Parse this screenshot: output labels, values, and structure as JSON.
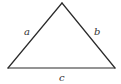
{
  "diagram": {
    "type": "triangle",
    "vertices": {
      "apex": {
        "x": 62,
        "y": 3
      },
      "bottom_left": {
        "x": 8,
        "y": 68
      },
      "bottom_right": {
        "x": 115,
        "y": 68
      }
    },
    "sides": [
      {
        "id": "a",
        "label": "a",
        "from": "bottom_left",
        "to": "apex",
        "label_pos": {
          "x": 24,
          "y": 35
        }
      },
      {
        "id": "b",
        "label": "b",
        "from": "apex",
        "to": "bottom_right",
        "label_pos": {
          "x": 94,
          "y": 35
        }
      },
      {
        "id": "c",
        "label": "c",
        "from": "bottom_left",
        "to": "bottom_right",
        "label_pos": {
          "x": 59,
          "y": 81
        }
      }
    ],
    "colors": {
      "stroke": "#2a2a2a",
      "label": "#333333",
      "background": "#ffffff"
    }
  }
}
